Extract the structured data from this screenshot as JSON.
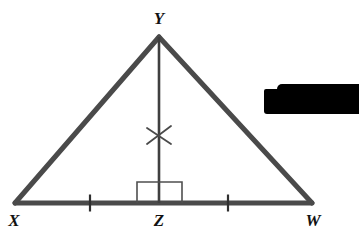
{
  "figure": {
    "kind": "geometry-diagram",
    "background_color": "#ffffff",
    "stroke_color": "#4a4a4a",
    "mark_color": "#3c3c3c",
    "label_color": "#121212",
    "width": 359,
    "height": 250,
    "vertices": [
      {
        "name": "Y",
        "label": "Y",
        "x": 159,
        "y": 37,
        "label_x": 159,
        "label_y": 18
      },
      {
        "name": "X",
        "label": "X",
        "x": 15,
        "y": 203,
        "label_x": 14,
        "label_y": 220
      },
      {
        "name": "Z",
        "label": "Z",
        "x": 159,
        "y": 203,
        "label_x": 159,
        "label_y": 220
      },
      {
        "name": "W",
        "label": "W",
        "x": 312,
        "y": 203,
        "label_x": 313,
        "label_y": 220
      }
    ],
    "segments": [
      {
        "name": "side-XY",
        "x1": 15,
        "y1": 203,
        "x2": 159,
        "y2": 37,
        "width": 5
      },
      {
        "name": "side-YW",
        "x1": 159,
        "y1": 37,
        "x2": 312,
        "y2": 203,
        "width": 5
      },
      {
        "name": "base-XW",
        "x1": 15,
        "y1": 203,
        "x2": 312,
        "y2": 203,
        "width": 5
      },
      {
        "name": "altitude-YZ",
        "x1": 159,
        "y1": 37,
        "x2": 159,
        "y2": 203,
        "width": 2.6
      }
    ],
    "right_angle_marker": {
      "name": "right-angle-at-Z",
      "x": 137,
      "y": 182,
      "width": 45,
      "height": 21,
      "stroke_width": 1.6
    },
    "tick_marks": [
      {
        "name": "tick-XZ",
        "x": 90,
        "y": 203,
        "length": 17,
        "stroke_width": 2.2
      },
      {
        "name": "tick-ZW",
        "x": 228,
        "y": 203,
        "length": 17,
        "stroke_width": 2.2
      }
    ],
    "cross_mark": {
      "name": "cross-mark-on-altitude",
      "cx": 159,
      "cy": 135,
      "arm": 12,
      "stroke_width": 1.8
    }
  },
  "redaction": {
    "name": "redacted-text-bar",
    "color": "#000000",
    "x": 264,
    "y": 89,
    "width": 95,
    "height": 25
  }
}
